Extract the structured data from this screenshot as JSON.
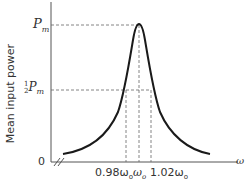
{
  "diagram": {
    "y_axis_label": "Mean input power",
    "x_axis_label": "ω",
    "y_ticks": {
      "max": "P",
      "max_sub": "m",
      "half_frac": "1",
      "half_den": "2",
      "half": "P",
      "half_sub": "m",
      "zero": "0"
    },
    "x_ticks": {
      "left": "0.98ω",
      "left_sub": "o",
      "center": "ω",
      "center_sub": "o",
      "right": "1.02ω",
      "right_sub": "o"
    },
    "colors": {
      "curve": "#1a1a1a",
      "axis": "#555555",
      "dashed": "#666666"
    }
  }
}
